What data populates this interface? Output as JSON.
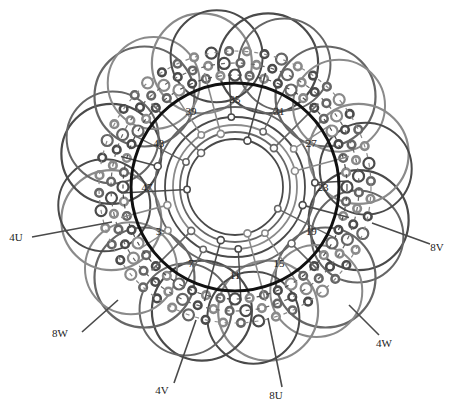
{
  "diagram": {
    "type": "stator-winding-diagram",
    "center": [
      235,
      187
    ],
    "colors": {
      "stator_ring": "#111111",
      "phase_dark": "#4a4a4a",
      "phase_mid": "#666666",
      "phase_light": "#8a8a8a",
      "label": "#222222"
    },
    "stator_ring_radius": 104,
    "inner_rings": [
      48,
      55,
      62,
      70,
      80
    ],
    "slot_labels": [
      {
        "text": "35",
        "angle": -90,
        "r": 88
      },
      {
        "text": "31",
        "angle": -60,
        "r": 88
      },
      {
        "text": "27",
        "angle": -30,
        "r": 88
      },
      {
        "text": "23",
        "angle": 0,
        "r": 88
      },
      {
        "text": "19",
        "angle": 30,
        "r": 88
      },
      {
        "text": "15",
        "angle": 60,
        "r": 88
      },
      {
        "text": "11",
        "angle": 90,
        "r": 88
      },
      {
        "text": "7",
        "angle": 120,
        "r": 88
      },
      {
        "text": "3",
        "angle": 150,
        "r": 88
      },
      {
        "text": "47",
        "angle": 180,
        "r": 88
      },
      {
        "text": "43",
        "angle": 210,
        "r": 88
      },
      {
        "text": "39",
        "angle": 240,
        "r": 88
      }
    ],
    "coil_loops": {
      "count": 12,
      "center_r": 128,
      "radius": 50,
      "offset_deg": 15
    },
    "lead_labels": [
      {
        "text": "4U",
        "x": 16,
        "y": 241,
        "line": [
          [
            32,
            237
          ],
          [
            112,
            222
          ]
        ]
      },
      {
        "text": "8V",
        "x": 437,
        "y": 251,
        "line": [
          [
            430,
            244
          ],
          [
            372,
            223
          ]
        ]
      },
      {
        "text": "8W",
        "x": 60,
        "y": 337,
        "line": [
          [
            82,
            332
          ],
          [
            118,
            300
          ]
        ]
      },
      {
        "text": "4V",
        "x": 162,
        "y": 394,
        "line": [
          [
            174,
            383
          ],
          [
            196,
            320
          ]
        ]
      },
      {
        "text": "8U",
        "x": 276,
        "y": 399,
        "line": [
          [
            282,
            387
          ],
          [
            268,
            318
          ]
        ]
      },
      {
        "text": "4W",
        "x": 384,
        "y": 347,
        "line": [
          [
            379,
            335
          ],
          [
            349,
            305
          ]
        ]
      }
    ]
  }
}
